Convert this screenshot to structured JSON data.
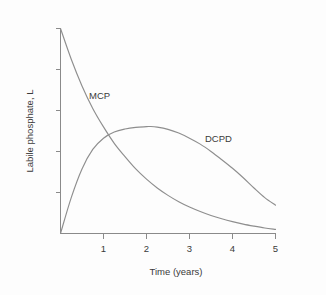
{
  "chart_data": {
    "type": "line",
    "title": "",
    "xlabel": "Time (years)",
    "ylabel": "Labile phosphate, L",
    "xlim": [
      0,
      5
    ],
    "ylim": [
      0,
      1
    ],
    "grid": false,
    "legend_position": "inline-annotation",
    "xticks": [
      1,
      2,
      3,
      4,
      5
    ],
    "xtick_labels": [
      "1",
      "2",
      "3",
      "4",
      "5"
    ],
    "yticks": [
      0.2,
      0.4,
      0.6,
      0.8,
      1.0
    ],
    "ytick_labels": [
      "",
      "",
      "",
      "",
      ""
    ],
    "series": [
      {
        "name": "MCP",
        "label": "MCP",
        "color": "#8e8e8e",
        "x": [
          0.0,
          0.25,
          0.5,
          0.75,
          1.0,
          1.25,
          1.5,
          1.75,
          2.0,
          2.25,
          2.5,
          2.75,
          3.0,
          3.25,
          3.5,
          3.75,
          4.0,
          4.25,
          4.5,
          4.75,
          5.0
        ],
        "values": [
          1.0,
          0.85,
          0.72,
          0.61,
          0.52,
          0.44,
          0.375,
          0.315,
          0.265,
          0.222,
          0.186,
          0.155,
          0.129,
          0.107,
          0.088,
          0.072,
          0.058,
          0.046,
          0.036,
          0.027,
          0.02
        ]
      },
      {
        "name": "DCPD",
        "label": "DCPD",
        "color": "#8e8e8e",
        "x": [
          0.0,
          0.25,
          0.5,
          0.75,
          1.0,
          1.25,
          1.5,
          1.75,
          2.0,
          2.1,
          2.25,
          2.5,
          2.75,
          3.0,
          3.25,
          3.5,
          3.75,
          4.0,
          4.25,
          4.5,
          4.75,
          5.0
        ],
        "values": [
          0.0,
          0.175,
          0.315,
          0.41,
          0.465,
          0.495,
          0.51,
          0.518,
          0.521,
          0.522,
          0.519,
          0.508,
          0.49,
          0.465,
          0.436,
          0.4,
          0.36,
          0.318,
          0.272,
          0.222,
          0.175,
          0.138
        ]
      }
    ],
    "annotations": [
      {
        "text": "MCP",
        "x": 0.68,
        "y": 0.68
      },
      {
        "text": "DCPD",
        "x": 3.42,
        "y": 0.5
      }
    ]
  },
  "axis": {
    "x_title": "Time (years)",
    "y_title": "Labile phosphate, L"
  },
  "tick_labels": {
    "x": [
      "1",
      "2",
      "3",
      "4",
      "5"
    ]
  },
  "series_labels": {
    "mcp": "MCP",
    "dcpd": "DCPD"
  },
  "colors": {
    "background": "#fdfdfd",
    "axis": "#8a8a8a",
    "curve": "#8e8e8e",
    "text": "#3a3a3a"
  }
}
